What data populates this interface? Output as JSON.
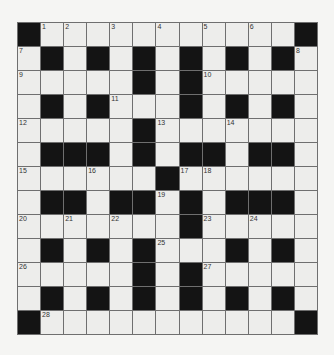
{
  "puzzle": {
    "rows": 13,
    "cols": 13,
    "colors": {
      "black": "#141414",
      "white": "#ededeb",
      "border": "#6f6f6f",
      "background": "#f5f5f3"
    },
    "layout": [
      "#...........#",
      ".#.#.#.#.#.#.",
      ".....#.#.....",
      ".#.#...#.#.#.",
      ".....#.......",
      ".###.#.##.##.",
      "......#......",
      ".##.##.#.###.",
      ".......#.....",
      ".#.#.#...#.#.",
      ".....#.#.....",
      ".#.#.#.#.#.#.",
      "#...........#"
    ],
    "numbers": [
      {
        "r": 0,
        "c": 1,
        "n": "1"
      },
      {
        "r": 0,
        "c": 2,
        "n": "2"
      },
      {
        "r": 0,
        "c": 4,
        "n": "3"
      },
      {
        "r": 0,
        "c": 6,
        "n": "4"
      },
      {
        "r": 0,
        "c": 8,
        "n": "5"
      },
      {
        "r": 0,
        "c": 10,
        "n": "6"
      },
      {
        "r": 1,
        "c": 0,
        "n": "7"
      },
      {
        "r": 1,
        "c": 12,
        "n": "8"
      },
      {
        "r": 2,
        "c": 0,
        "n": "9"
      },
      {
        "r": 2,
        "c": 8,
        "n": "10"
      },
      {
        "r": 3,
        "c": 4,
        "n": "11"
      },
      {
        "r": 4,
        "c": 0,
        "n": "12"
      },
      {
        "r": 4,
        "c": 6,
        "n": "13"
      },
      {
        "r": 4,
        "c": 9,
        "n": "14"
      },
      {
        "r": 6,
        "c": 0,
        "n": "15"
      },
      {
        "r": 6,
        "c": 3,
        "n": "16"
      },
      {
        "r": 6,
        "c": 7,
        "n": "17"
      },
      {
        "r": 6,
        "c": 8,
        "n": "18"
      },
      {
        "r": 7,
        "c": 6,
        "n": "19"
      },
      {
        "r": 8,
        "c": 0,
        "n": "20"
      },
      {
        "r": 8,
        "c": 2,
        "n": "21"
      },
      {
        "r": 8,
        "c": 4,
        "n": "22"
      },
      {
        "r": 8,
        "c": 8,
        "n": "23"
      },
      {
        "r": 8,
        "c": 10,
        "n": "24"
      },
      {
        "r": 9,
        "c": 6,
        "n": "25"
      },
      {
        "r": 10,
        "c": 0,
        "n": "26"
      },
      {
        "r": 10,
        "c": 8,
        "n": "27"
      },
      {
        "r": 12,
        "c": 1,
        "n": "28"
      }
    ]
  }
}
